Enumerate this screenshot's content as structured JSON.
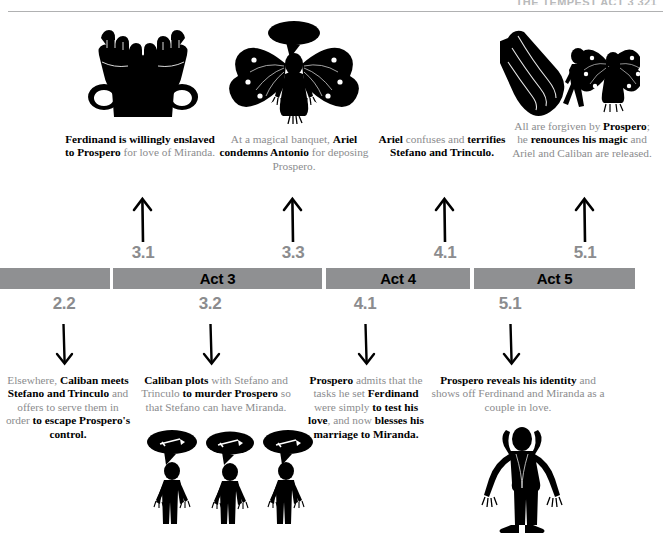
{
  "header": {
    "title": "THE TEMPEST  ACT 3  321"
  },
  "act_bar": {
    "segments": [
      {
        "label": "",
        "name": "act-segment-2"
      },
      {
        "label": "Act 3",
        "name": "act-segment-3"
      },
      {
        "label": "Act 4",
        "name": "act-segment-4"
      },
      {
        "label": "Act 5",
        "name": "act-segment-5"
      }
    ]
  },
  "above": {
    "scene_numbers": [
      "3.1",
      "3.3",
      "4.1",
      "5.1"
    ],
    "events": [
      {
        "icon": "shackled-fists-icon",
        "parts": [
          {
            "text": "Ferdinand is willingly enslaved to Prospero ",
            "bold": true
          },
          {
            "text": "for love of Miranda.",
            "bold": false
          }
        ],
        "plain": "Ferdinand is willingly enslaved to Prospero for love of Miranda."
      },
      {
        "icon": "winged-ariel-speaking-icon",
        "parts": [
          {
            "text": "At a magical banquet, ",
            "bold": false
          },
          {
            "text": "Ariel condemns Antonio ",
            "bold": true
          },
          {
            "text": "for deposing Prospero.",
            "bold": false
          }
        ],
        "plain": "At a magical banquet, Ariel condemns Antonio for deposing Prospero."
      },
      {
        "icon": "",
        "parts": [
          {
            "text": "Ariel ",
            "bold": true
          },
          {
            "text": "confuses and ",
            "bold": false
          },
          {
            "text": "terrifies Stefano and Trinculo",
            "bold": true
          },
          {
            "text": ".",
            "bold": false
          }
        ],
        "plain": "Ariel confuses and terrifies Stefano and Trinculo."
      },
      {
        "icon": "hand-releasing-figures-icon",
        "parts": [
          {
            "text": "All are forgiven by ",
            "bold": false
          },
          {
            "text": "Prospero",
            "bold": true
          },
          {
            "text": "; he ",
            "bold": false
          },
          {
            "text": "renounces his magic ",
            "bold": true
          },
          {
            "text": "and Ariel and Caliban are released.",
            "bold": false
          }
        ],
        "plain": "All are forgiven by Prospero; he renounces his magic and Ariel and Caliban are released."
      }
    ]
  },
  "below": {
    "scene_numbers": [
      "2.2",
      "3.2",
      "4.1",
      "5.1"
    ],
    "events": [
      {
        "icon": "",
        "parts": [
          {
            "text": "Elsewhere, ",
            "bold": false
          },
          {
            "text": "Caliban meets Stefano and Trinculo ",
            "bold": true
          },
          {
            "text": "and offers to serve them in order ",
            "bold": false
          },
          {
            "text": "to escape Prospero's control",
            "bold": true
          },
          {
            "text": ".",
            "bold": false
          }
        ],
        "plain": "Elsewhere, Caliban meets Stefano and Trinculo and offers to serve them in order to escape Prospero's control."
      },
      {
        "icon": "three-plotters-with-dagger-bubbles-icon",
        "parts": [
          {
            "text": "Caliban plots ",
            "bold": true
          },
          {
            "text": "with Stefano and Trinculo ",
            "bold": false
          },
          {
            "text": "to murder Prospero ",
            "bold": true
          },
          {
            "text": "so that Stefano can have Miranda.",
            "bold": false
          }
        ],
        "plain": "Caliban plots with Stefano and Trinculo to murder Prospero so that Stefano can have Miranda."
      },
      {
        "icon": "",
        "parts": [
          {
            "text": "Prospero ",
            "bold": true
          },
          {
            "text": "admits that the tasks he set ",
            "bold": false
          },
          {
            "text": "Ferdinand ",
            "bold": true
          },
          {
            "text": "were simply ",
            "bold": false
          },
          {
            "text": "to test his love",
            "bold": true
          },
          {
            "text": ", and now ",
            "bold": false
          },
          {
            "text": "blesses his marriage to Miranda",
            "bold": true
          },
          {
            "text": ".",
            "bold": false
          }
        ],
        "plain": "Prospero admits that the tasks he set Ferdinand were simply to test his love, and now blesses his marriage to Miranda."
      },
      {
        "icon": "figure-arms-outstretched-icon",
        "parts": [
          {
            "text": "Prospero reveals his identity ",
            "bold": true
          },
          {
            "text": "and shows off Ferdinand and Miranda as a couple in love.",
            "bold": false
          }
        ],
        "plain": "Prospero reveals his identity and shows off Ferdinand and Miranda as a couple in love."
      }
    ]
  },
  "colors": {
    "bar": "#8f9092",
    "muted_text": "#8b8c8e",
    "ink": "#000000",
    "rule": "#b0b1b2"
  }
}
